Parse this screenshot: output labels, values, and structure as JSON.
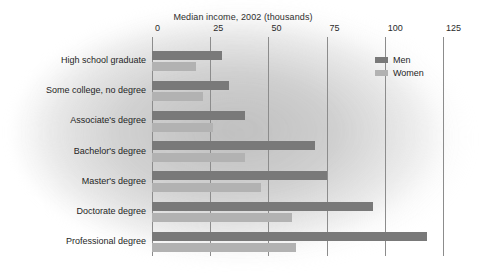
{
  "chart_data": {
    "type": "bar",
    "orientation": "horizontal",
    "title": "Median income, 2002 (thousands)",
    "xlabel": "",
    "ylabel": "",
    "xlim": [
      0,
      125
    ],
    "xticks": [
      0,
      25,
      50,
      75,
      100,
      125
    ],
    "xtick_labels": [
      "0",
      "25",
      "50",
      "75",
      "100",
      "125"
    ],
    "grid": "vertical",
    "legend_position": "top-right",
    "categories": [
      "High school graduate",
      "Some college, no degree",
      "Associate's degree",
      "Bachelor's degree",
      "Master's degree",
      "Doctorate degree",
      "Professional degree"
    ],
    "series": [
      {
        "name": "Men",
        "color": "#797979",
        "values": [
          30,
          33,
          40,
          70,
          75,
          95,
          118
        ]
      },
      {
        "name": "Women",
        "color": "#b2b2b2",
        "values": [
          19,
          22,
          26,
          40,
          47,
          60,
          62
        ]
      }
    ]
  }
}
